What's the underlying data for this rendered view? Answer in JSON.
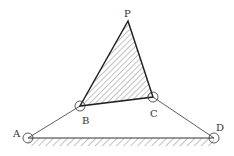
{
  "diagram": {
    "type": "four-bar linkage with coupler triangle",
    "labels": {
      "P": "P",
      "A": "A",
      "B": "B",
      "C": "C",
      "D": "D"
    },
    "points": {
      "P": [
        128,
        21
      ],
      "A": [
        28,
        138
      ],
      "B": [
        80,
        106
      ],
      "C": [
        153,
        97
      ],
      "D": [
        214,
        138
      ]
    },
    "colors": {
      "line": "#333333",
      "hatch": "#555555",
      "background": "#ffffff"
    }
  }
}
